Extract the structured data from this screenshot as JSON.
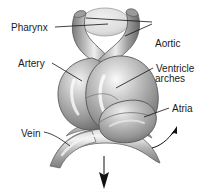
{
  "figure": {
    "background_color": "#ffffff",
    "text_color": "#1a1a1a",
    "line_color": "#111111",
    "tissue_mid_gray": "#a5a5a5",
    "tissue_dark_gray": "#6e6e6e",
    "tissue_light_gray": "#e6e6e6",
    "pharynx_fill": "#dcdcdc",
    "width": 212,
    "height": 193
  },
  "labels": {
    "pharynx": "Pharynx",
    "aortic_line1": "Aortic",
    "aortic_line2": "arches",
    "artery": "Artery",
    "ventricle": "Ventricle",
    "atria": "Atria",
    "vein": "Vein"
  },
  "arrows": {
    "bottom_flow": "down-arrow",
    "right_flow": "curved-up-right-arrow"
  }
}
